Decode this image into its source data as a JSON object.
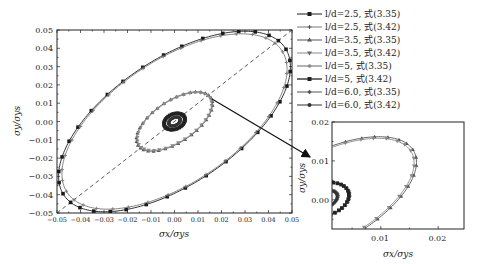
{
  "chart_data": [
    {
      "id": "main",
      "type": "line",
      "title": "",
      "xlabel": "σx/σys",
      "ylabel": "σy/σys",
      "xlim": [
        -0.05,
        0.05
      ],
      "ylim": [
        -0.05,
        0.05
      ],
      "xticks": [
        "−0.05",
        "−0.04",
        "−0.03",
        "−0.02",
        "−0.01",
        "0.00",
        "0.01",
        "0.02",
        "0.03",
        "0.04",
        "0.05"
      ],
      "yticks": [
        "0.05",
        "0.04",
        "0.03",
        "0.02",
        "0.01",
        "0.00",
        "−0.01",
        "−0.02",
        "−0.03",
        "−0.04",
        "−0.05"
      ],
      "grid": false,
      "reference_line": {
        "style": "dashed",
        "from": [
          -0.05,
          -0.05
        ],
        "to": [
          0.05,
          0.05
        ]
      },
      "series": [
        {
          "name": "l/d=2.5, 式(3.35)",
          "shape": "ellipse",
          "center": [
            0,
            0
          ],
          "semi_major": 0.0625,
          "semi_minor": 0.031,
          "angle_deg": 45,
          "color": "#1a1a1a",
          "marker": "square"
        },
        {
          "name": "l/d=2.5, 式(3.42)",
          "shape": "ellipse",
          "center": [
            0,
            0
          ],
          "semi_major": 0.0605,
          "semi_minor": 0.0305,
          "angle_deg": 45,
          "color": "#777777",
          "marker": "plus"
        },
        {
          "name": "l/d=3.5, 式(3.35)",
          "shape": "ellipse",
          "center": [
            0,
            0
          ],
          "semi_major": 0.0205,
          "semi_minor": 0.0103,
          "angle_deg": 45,
          "color": "#555555",
          "marker": "triangle"
        },
        {
          "name": "l/d=3.5, 式(3.42)",
          "shape": "ellipse",
          "center": [
            0,
            0
          ],
          "semi_major": 0.02,
          "semi_minor": 0.01,
          "angle_deg": 45,
          "color": "#888888",
          "marker": "down-triangle"
        },
        {
          "name": "l/d=5, 式(3.35)",
          "shape": "ellipse",
          "center": [
            0,
            0
          ],
          "semi_major": 0.0052,
          "semi_minor": 0.004,
          "angle_deg": 45,
          "color": "#666666",
          "marker": "circle"
        },
        {
          "name": "l/d=5, 式(3.42)",
          "shape": "ellipse",
          "center": [
            0,
            0
          ],
          "semi_major": 0.005,
          "semi_minor": 0.0038,
          "angle_deg": 45,
          "color": "#222222",
          "marker": "square"
        },
        {
          "name": "l/d=6.0, 式(3.35)",
          "shape": "ellipse",
          "center": [
            0,
            0
          ],
          "semi_major": 0.003,
          "semi_minor": 0.002,
          "angle_deg": 45,
          "color": "#555555",
          "marker": "diamond"
        },
        {
          "name": "l/d=6.0, 式(3.42)",
          "shape": "ellipse",
          "center": [
            0,
            0
          ],
          "semi_major": 0.0028,
          "semi_minor": 0.0019,
          "angle_deg": 45,
          "color": "#333333",
          "marker": "dot"
        }
      ],
      "legend_position": "right, outside top"
    },
    {
      "id": "inset",
      "type": "line",
      "title": "",
      "xlabel": "σx/σys",
      "ylabel": "σy/σys",
      "xlim": [
        0.0015,
        0.0245
      ],
      "ylim": [
        -0.0075,
        0.02
      ],
      "xticks": [
        "0.01",
        "0.02"
      ],
      "yticks": [
        "0.02",
        "0.01",
        "0.00"
      ],
      "note": "Magnified view of central region (arrow from main plot)",
      "grid": false
    }
  ],
  "legend": {
    "items": [
      {
        "label": "l/d=2.5, 式(3.35)",
        "marker": "square",
        "color": "#1a1a1a"
      },
      {
        "label": "l/d=2.5, 式(3.42)",
        "marker": "plus",
        "color": "#777777"
      },
      {
        "label": "l/d=3.5, 式(3.35)",
        "marker": "triangle",
        "color": "#555555"
      },
      {
        "label": "l/d=3.5, 式(3.42)",
        "marker": "down-triangle",
        "color": "#888888"
      },
      {
        "label": "l/d=5, 式(3.35)",
        "marker": "circle",
        "color": "#666666"
      },
      {
        "label": "l/d=5, 式(3.42)",
        "marker": "square",
        "color": "#222222"
      },
      {
        "label": "l/d=6.0, 式(3.35)",
        "marker": "diamond",
        "color": "#555555"
      },
      {
        "label": "l/d=6.0, 式(3.42)",
        "marker": "dot",
        "color": "#333333"
      }
    ]
  },
  "main": {
    "xlabel": "σx/σys",
    "ylabel": "σy/σys",
    "xticks": [
      "−0.05",
      "−0.04",
      "−0.03",
      "−0.02",
      "−0.01",
      "0.00",
      "0.01",
      "0.02",
      "0.03",
      "0.04",
      "0.05"
    ],
    "yticks": [
      "0.05",
      "0.04",
      "0.03",
      "0.02",
      "0.01",
      "0.00",
      "−0.01",
      "−0.02",
      "−0.03",
      "−0.04",
      "−0.05"
    ]
  },
  "inset": {
    "xlabel": "σx/σys",
    "ylabel": "σy/σys",
    "xticks": [
      "0.01",
      "0.02"
    ],
    "yticks": [
      "0.02",
      "0.01",
      "0.00"
    ]
  }
}
